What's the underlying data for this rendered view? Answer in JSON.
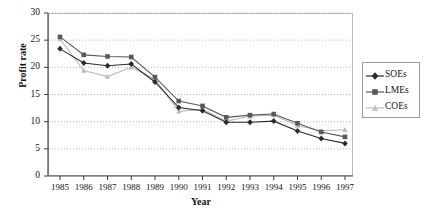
{
  "chart_data": {
    "type": "line",
    "title": "",
    "xlabel": "Year",
    "ylabel": "Profit rate",
    "categories": [
      1985,
      1986,
      1987,
      1988,
      1989,
      1990,
      1991,
      1992,
      1993,
      1994,
      1995,
      1996,
      1997
    ],
    "x_tick_labels": [
      "1985",
      "1986",
      "1987",
      "1988",
      "1989",
      "1990",
      "1991",
      "1992",
      "1993",
      "1994",
      "1995",
      "1996",
      "1997"
    ],
    "y_tick_labels": [
      "0",
      "5",
      "10",
      "15",
      "20",
      "25",
      "30"
    ],
    "y_ticks": [
      0,
      5,
      10,
      15,
      20,
      25,
      30
    ],
    "ylim": [
      0,
      30
    ],
    "grid": "horizontal-dotted",
    "legend_position": "right-outside",
    "series": [
      {
        "name": "SOEs",
        "marker": "diamond",
        "color": "#2b2b2b",
        "values": [
          23.4,
          20.8,
          20.3,
          20.6,
          17.3,
          12.6,
          12.0,
          9.9,
          9.9,
          10.1,
          8.3,
          6.9,
          6.0
        ]
      },
      {
        "name": "LMEs",
        "marker": "square",
        "color": "#585858",
        "values": [
          25.6,
          22.3,
          22.0,
          21.9,
          18.2,
          13.8,
          12.9,
          10.8,
          11.2,
          11.4,
          9.7,
          8.1,
          7.2
        ]
      },
      {
        "name": "COEs",
        "marker": "triangle",
        "color": "#bcbcbc",
        "values": [
          25.2,
          19.4,
          18.3,
          20.0,
          17.8,
          11.9,
          12.3,
          10.1,
          11.0,
          11.2,
          9.3,
          8.3,
          8.5
        ]
      }
    ]
  },
  "legend": {
    "items": [
      {
        "label": "SOEs"
      },
      {
        "label": "LMEs"
      },
      {
        "label": "COEs"
      }
    ]
  },
  "axis_titles": {
    "x": "Year",
    "y": "Profit rate"
  }
}
